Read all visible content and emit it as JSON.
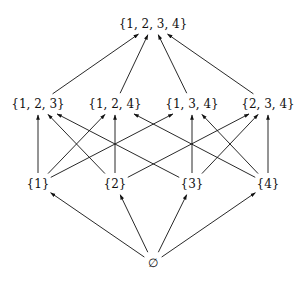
{
  "diagram": {
    "type": "hasse-diagram",
    "nodes": [
      {
        "id": "top",
        "label": "{1, 2, 3, 4}",
        "x": 153,
        "y": 24
      },
      {
        "id": "123",
        "label": "{1, 2, 3}",
        "x": 38,
        "y": 104
      },
      {
        "id": "124",
        "label": "{1, 2, 4}",
        "x": 115,
        "y": 104
      },
      {
        "id": "134",
        "label": "{1, 3, 4}",
        "x": 192,
        "y": 104
      },
      {
        "id": "234",
        "label": "{2, 3, 4}",
        "x": 268,
        "y": 104
      },
      {
        "id": "1",
        "label": "{1}",
        "x": 38,
        "y": 184
      },
      {
        "id": "2",
        "label": "{2}",
        "x": 115,
        "y": 184
      },
      {
        "id": "3",
        "label": "{3}",
        "x": 192,
        "y": 184
      },
      {
        "id": "4",
        "label": "{4}",
        "x": 268,
        "y": 184
      },
      {
        "id": "empty",
        "label": "∅",
        "x": 153,
        "y": 263
      }
    ],
    "edges": [
      [
        "123",
        "top"
      ],
      [
        "124",
        "top"
      ],
      [
        "134",
        "top"
      ],
      [
        "234",
        "top"
      ],
      [
        "1",
        "123"
      ],
      [
        "1",
        "124"
      ],
      [
        "1",
        "134"
      ],
      [
        "2",
        "123"
      ],
      [
        "2",
        "124"
      ],
      [
        "2",
        "234"
      ],
      [
        "3",
        "123"
      ],
      [
        "3",
        "134"
      ],
      [
        "3",
        "234"
      ],
      [
        "4",
        "124"
      ],
      [
        "4",
        "134"
      ],
      [
        "4",
        "234"
      ],
      [
        "empty",
        "1"
      ],
      [
        "empty",
        "2"
      ],
      [
        "empty",
        "3"
      ],
      [
        "empty",
        "4"
      ]
    ]
  }
}
